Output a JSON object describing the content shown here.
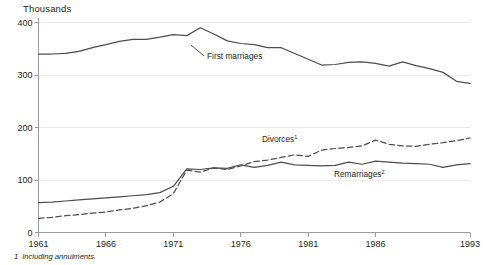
{
  "chart_data": {
    "type": "line",
    "title": "Thousands",
    "xlabel": "",
    "ylabel": "Thousands",
    "xlim": [
      1961,
      1993
    ],
    "ylim": [
      0,
      400
    ],
    "yticks": [
      0,
      100,
      200,
      300,
      400
    ],
    "xticks": [
      1961,
      1966,
      1971,
      1976,
      1981,
      1986,
      1993
    ],
    "grid": "horizontal",
    "legend_position": "inline-annotations",
    "x": [
      1961,
      1962,
      1963,
      1964,
      1965,
      1966,
      1967,
      1968,
      1969,
      1970,
      1971,
      1972,
      1973,
      1974,
      1975,
      1976,
      1977,
      1978,
      1979,
      1980,
      1981,
      1982,
      1983,
      1984,
      1985,
      1986,
      1987,
      1988,
      1989,
      1990,
      1991,
      1992,
      1993
    ],
    "series": [
      {
        "name": "First marriages",
        "style": "solid",
        "label": "First marriages",
        "footnote_marker": "",
        "values": [
          340,
          340,
          341,
          345,
          352,
          358,
          364,
          368,
          368,
          372,
          377,
          375,
          390,
          378,
          365,
          360,
          358,
          352,
          352,
          341,
          330,
          319,
          320,
          324,
          325,
          322,
          317,
          325,
          318,
          312,
          305,
          288,
          284
        ]
      },
      {
        "name": "Divorces",
        "style": "dashed",
        "label": "Divorces",
        "footnote_marker": "1",
        "values": [
          27,
          29,
          32,
          34,
          37,
          39,
          43,
          46,
          51,
          58,
          74,
          119,
          115,
          123,
          120,
          127,
          135,
          138,
          143,
          148,
          145,
          157,
          160,
          162,
          165,
          176,
          168,
          165,
          164,
          168,
          171,
          175,
          180
        ]
      },
      {
        "name": "Remarriages",
        "style": "solid",
        "label": "Remarriages",
        "footnote_marker": "2",
        "values": [
          57,
          58,
          60,
          62,
          64,
          66,
          68,
          70,
          72,
          76,
          88,
          121,
          120,
          123,
          122,
          129,
          124,
          128,
          134,
          129,
          128,
          127,
          128,
          134,
          130,
          136,
          134,
          132,
          131,
          130,
          124,
          129,
          131
        ]
      }
    ],
    "annotations": [
      {
        "text": "First marriages",
        "marker": "",
        "x_px": 207,
        "y_px": 59
      },
      {
        "text": "Divorces",
        "marker": "1",
        "x_px": 262,
        "y_px": 142
      },
      {
        "text": "Remarriages",
        "marker": "2",
        "x_px": 334,
        "y_px": 177
      }
    ],
    "footnotes": [
      {
        "num": "1",
        "text": "Including annulments."
      }
    ]
  },
  "footnote": {
    "num": "1",
    "text": "Including annulments."
  },
  "axis": {
    "title": "Thousands"
  }
}
